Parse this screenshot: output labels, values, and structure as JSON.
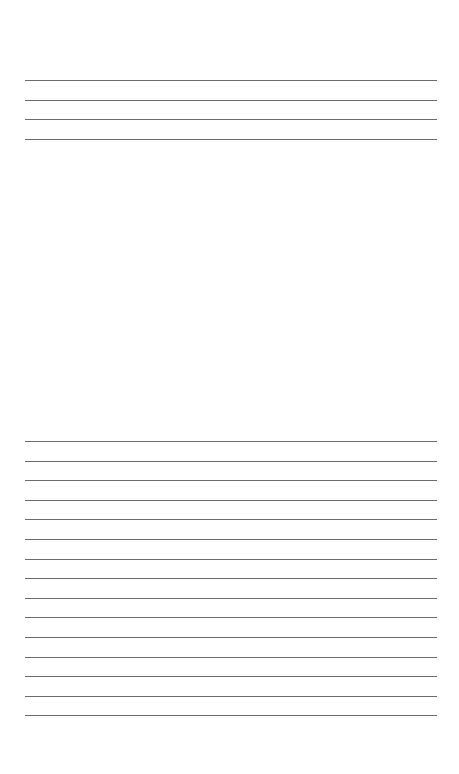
{
  "page": {
    "type": "ruled-sheet",
    "background": "#ffffff",
    "line_color": "#6b6b6b"
  },
  "top_section": {
    "line_count": 4,
    "start_y": 80,
    "spacing": 19.7
  },
  "bottom_section": {
    "line_count": 15,
    "start_y": 441,
    "spacing": 19.6
  }
}
